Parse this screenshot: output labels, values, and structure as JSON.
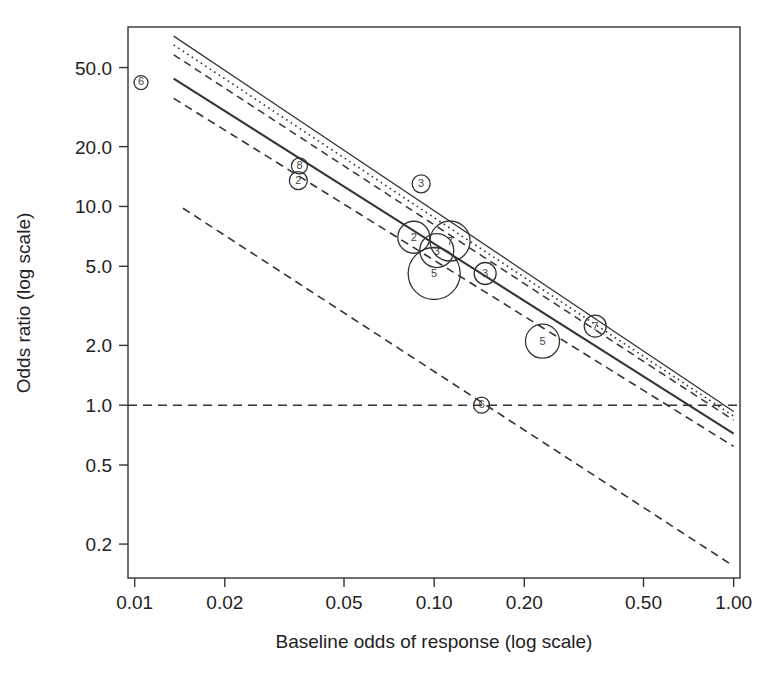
{
  "figure": {
    "background_color": "#ffffff",
    "ink_color": "#333333",
    "frame": {
      "x0": 128,
      "y0": 27,
      "x1": 740,
      "y1": 578
    }
  },
  "chart_data": {
    "type": "scatter",
    "title": "",
    "subtitle": "",
    "xlabel": "Baseline odds of response (log scale)",
    "ylabel": "Odds ratio (log scale)",
    "xscale": "log",
    "yscale": "log",
    "xlim": [
      0.0095,
      1.05
    ],
    "ylim": [
      0.135,
      80
    ],
    "grid": false,
    "legend": "none",
    "xticks": [
      0.01,
      0.02,
      0.05,
      0.1,
      0.2,
      0.5,
      1.0
    ],
    "xticklabels": [
      "0.01",
      "0.02",
      "0.05",
      "0.10",
      "0.20",
      "0.50",
      "1.00"
    ],
    "yticks": [
      0.2,
      0.5,
      1.0,
      2.0,
      5.0,
      10.0,
      20.0,
      50.0
    ],
    "yticklabels": [
      "0.2",
      "0.5",
      "1.0",
      "2.0",
      "5.0",
      "10.0",
      "20.0",
      "50.0"
    ],
    "points": [
      {
        "label": "6",
        "x": 0.0105,
        "y": 42.0,
        "size_px": 7
      },
      {
        "label": "8",
        "x": 0.0355,
        "y": 16.0,
        "size_px": 8
      },
      {
        "label": "2",
        "x": 0.0352,
        "y": 13.5,
        "size_px": 9
      },
      {
        "label": "3",
        "x": 0.0905,
        "y": 13.0,
        "size_px": 9
      },
      {
        "label": "2",
        "x": 0.0855,
        "y": 7.0,
        "size_px": 16
      },
      {
        "label": "3",
        "x": 0.102,
        "y": 6.0,
        "size_px": 17
      },
      {
        "label": "7",
        "x": 0.113,
        "y": 6.7,
        "size_px": 20
      },
      {
        "label": "5",
        "x": 0.1,
        "y": 4.6,
        "size_px": 26
      },
      {
        "label": "3",
        "x": 0.148,
        "y": 4.6,
        "size_px": 11
      },
      {
        "label": "5",
        "x": 0.23,
        "y": 2.1,
        "size_px": 17
      },
      {
        "label": "7",
        "x": 0.345,
        "y": 2.5,
        "size_px": 11
      },
      {
        "label": "6",
        "x": 0.144,
        "y": 1.0,
        "size_px": 8
      }
    ],
    "reference_line": {
      "name": "null-effect",
      "y": 1.0,
      "style": "dashed"
    },
    "series": [
      {
        "name": "upper-solid-thin",
        "style": "solid",
        "width": 1.3,
        "x": [
          0.0135,
          1.0
        ],
        "y": [
          72.0,
          0.93
        ]
      },
      {
        "name": "dotted-band",
        "style": "dotted",
        "width": 1.6,
        "x": [
          0.0135,
          1.0
        ],
        "y": [
          65.0,
          0.88
        ]
      },
      {
        "name": "dashed-upper",
        "style": "dashed",
        "width": 1.5,
        "x": [
          0.0135,
          1.0
        ],
        "y": [
          58.0,
          0.84
        ]
      },
      {
        "name": "fitted-solid",
        "style": "solid",
        "width": 2.0,
        "x": [
          0.0135,
          1.0
        ],
        "y": [
          44.0,
          0.72
        ]
      },
      {
        "name": "dashed-lower",
        "style": "dashed",
        "width": 1.6,
        "x": [
          0.0135,
          1.0
        ],
        "y": [
          35.0,
          0.62
        ]
      },
      {
        "name": "outlier-regression",
        "style": "dashed",
        "width": 1.6,
        "x": [
          0.0145,
          1.0
        ],
        "y": [
          9.8,
          0.155
        ]
      }
    ]
  },
  "axis_labels": {
    "x": "Baseline odds of response (log scale)",
    "y": "Odds ratio (log scale)"
  }
}
